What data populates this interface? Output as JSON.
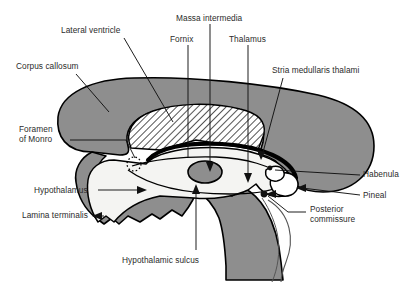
{
  "figure": {
    "type": "anatomical-diagram",
    "view": "midsagittal",
    "background_color": "#ffffff",
    "line_color": "#000000",
    "text_color": "#2b2b2b"
  },
  "regions": {
    "corpus_callosum_fill": "#8e8e8e",
    "lateral_ventricle_fill": "hatched-diagonal",
    "third_ventricle_fill": "#f2f2f0",
    "brainstem_fill": "#8e8e8e",
    "massa_intermedia_fill": "#8e8e8e",
    "pineal_fill": "#ffffff"
  },
  "labels": [
    {
      "id": "lateral-ventricle",
      "text": "Lateral ventricle",
      "x": 61,
      "y": 26,
      "pointer": "line"
    },
    {
      "id": "corpus-callosum",
      "text": "Corpus callosum",
      "x": 16,
      "y": 62,
      "pointer": "line"
    },
    {
      "id": "massa-intermedia",
      "text": "Massa intermedia",
      "x": 176,
      "y": 14,
      "pointer": "line"
    },
    {
      "id": "fornix",
      "text": "Fornix",
      "x": 170,
      "y": 35,
      "pointer": "line"
    },
    {
      "id": "thalamus",
      "text": "Thalamus",
      "x": 229,
      "y": 35,
      "pointer": "arrow"
    },
    {
      "id": "stria-medullaris-thalami",
      "text": "Stria medullaris thalami",
      "x": 272,
      "y": 66,
      "pointer": "line"
    },
    {
      "id": "foramen-of-monro",
      "text": "Foramen\nof Monro",
      "x": 19,
      "y": 125,
      "pointer": "line"
    },
    {
      "id": "habenula",
      "text": "Habenula",
      "x": 363,
      "y": 170,
      "pointer": "line"
    },
    {
      "id": "pineal",
      "text": "Pineal",
      "x": 363,
      "y": 191,
      "pointer": "arrow"
    },
    {
      "id": "posterior-commissure",
      "text": "Posterior\ncommissure",
      "x": 310,
      "y": 205,
      "pointer": "line"
    },
    {
      "id": "hypothalamus",
      "text": "Hypothalamus",
      "x": 34,
      "y": 186,
      "pointer": "arrow"
    },
    {
      "id": "lamina-terminalis",
      "text": "Lamina terminalis",
      "x": 22,
      "y": 211,
      "pointer": "arrow"
    },
    {
      "id": "hypothalamic-sulcus",
      "text": "Hypothalamic sulcus",
      "x": 122,
      "y": 256,
      "pointer": "line"
    }
  ]
}
